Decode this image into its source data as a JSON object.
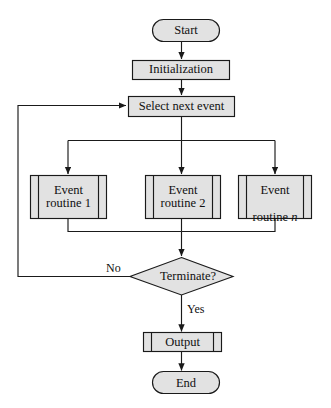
{
  "diagram": {
    "style": {
      "fill": "#e2e2e2",
      "stroke": "#1a1a1a",
      "text_color": "#101010",
      "background": "#ffffff"
    },
    "nodes": [
      {
        "id": "start",
        "shape": "terminator",
        "label": "Start"
      },
      {
        "id": "init",
        "shape": "process",
        "label": "Initialization"
      },
      {
        "id": "select",
        "shape": "process",
        "label": "Select next event"
      },
      {
        "id": "ev1",
        "shape": "predefined-process",
        "label": "Event\nroutine 1"
      },
      {
        "id": "ev2",
        "shape": "predefined-process",
        "label": "Event\nroutine 2"
      },
      {
        "id": "ev3",
        "shape": "predefined-process",
        "label": "Event\nroutine n",
        "label_main": "Event",
        "label_sub_prefix": "routine ",
        "label_sub_italic": "n"
      },
      {
        "id": "term",
        "shape": "decision",
        "label": "Terminate?"
      },
      {
        "id": "output",
        "shape": "predefined-process",
        "label": "Output"
      },
      {
        "id": "end",
        "shape": "terminator",
        "label": "End"
      }
    ],
    "edges": [
      {
        "from": "start",
        "to": "init",
        "label": ""
      },
      {
        "from": "init",
        "to": "select",
        "label": ""
      },
      {
        "from": "select",
        "to": "ev1",
        "label": ""
      },
      {
        "from": "select",
        "to": "ev2",
        "label": ""
      },
      {
        "from": "select",
        "to": "ev3",
        "label": ""
      },
      {
        "from": "ev1",
        "to": "term",
        "label": ""
      },
      {
        "from": "ev2",
        "to": "term",
        "label": ""
      },
      {
        "from": "ev3",
        "to": "term",
        "label": ""
      },
      {
        "from": "term",
        "to": "select",
        "label": "No"
      },
      {
        "from": "term",
        "to": "output",
        "label": "Yes"
      },
      {
        "from": "output",
        "to": "end",
        "label": ""
      }
    ],
    "edge_labels": {
      "no": "No",
      "yes": "Yes"
    }
  }
}
